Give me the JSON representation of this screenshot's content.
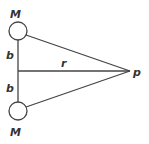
{
  "diagram": {
    "labels": {
      "top_mass": "M",
      "bottom_mass": "M",
      "upper_half": "b",
      "lower_half": "b",
      "distance": "r",
      "point": "p"
    },
    "colors": {
      "stroke": "#444444",
      "background": "#ffffff"
    }
  }
}
